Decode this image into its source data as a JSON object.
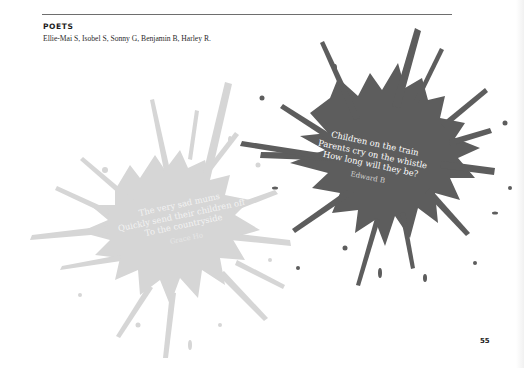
{
  "header": {
    "section_title": "POETS",
    "poets_list": "Ellie-Mai S, Isobel S, Sonny G, Benjamin B, Harley R."
  },
  "poems": [
    {
      "lines": [
        "The very sad mums",
        "Quickly send their children off",
        "To the countryside"
      ],
      "author": "Grace Ho",
      "splat_color": "#d4d4d4"
    },
    {
      "lines": [
        "Children on the train",
        "Parents cry on the whistle",
        "How long will they be?"
      ],
      "author": "Edward B",
      "splat_color": "#5e5e5e"
    }
  ],
  "footer": {
    "page_number": "55"
  }
}
